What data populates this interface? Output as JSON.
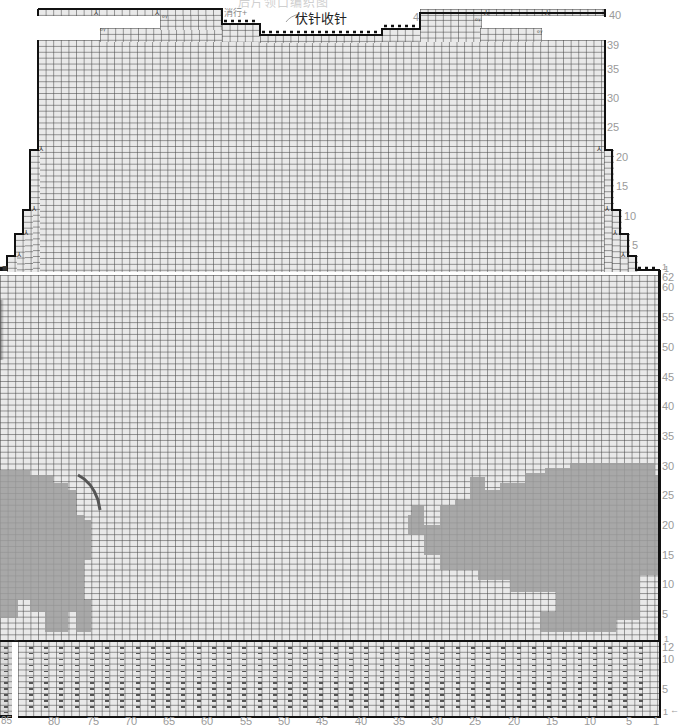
{
  "chart": {
    "type": "knitting-chart",
    "faded_header": "后片领口编织图",
    "annotations": {
      "bind_off_label": "伏针收针",
      "decrease_label": "消行+",
      "right_shoulder_number": "4",
      "corner_marker": "1",
      "rib_row_arrow": "←"
    },
    "symbols": {
      "decrease": "⅄",
      "cast_on_wrap": "ᵒᵞ",
      "purl": "—"
    },
    "colors": {
      "grid_bg": "#e9e9e9",
      "grid_line": "#8a8a8a",
      "motif_fill": "#9c9c9c",
      "outline": "#111111",
      "label": "#9a9a9a",
      "tail_stroke": "#555555"
    },
    "right_labels_upper": [
      "40",
      "39",
      "35",
      "30",
      "25",
      "20",
      "15",
      "10",
      "5",
      "1"
    ],
    "right_labels_body": [
      "62",
      "60",
      "55",
      "50",
      "45",
      "40",
      "35",
      "30",
      "25",
      "20",
      "15",
      "10",
      "5",
      "1"
    ],
    "right_labels_rib": [
      "12",
      "10",
      "5",
      "1"
    ],
    "bottom_labels": [
      "85",
      "80",
      "75",
      "70",
      "65",
      "60",
      "55",
      "50",
      "45",
      "40",
      "35",
      "30",
      "25",
      "20",
      "15",
      "10",
      "5",
      "1"
    ],
    "rib_corner_marker": "2"
  }
}
